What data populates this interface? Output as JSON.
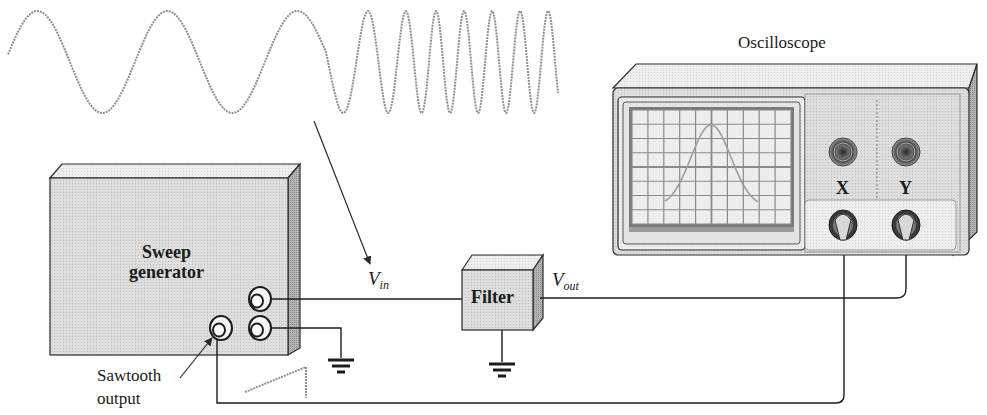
{
  "figure": {
    "input_waveform": {
      "description": "swept-frequency sine (chirp)",
      "slow_cycles": 3,
      "fast_cycles": 6
    },
    "sweep_generator": {
      "label_line1": "Sweep",
      "label_line2": "generator"
    },
    "sawtooth": {
      "label_line1": "Sawtooth",
      "label_line2": "output"
    },
    "signals": {
      "vin_main": "V",
      "vin_sub": "in",
      "vout_main": "V",
      "vout_sub": "out"
    },
    "filter": {
      "label": "Filter"
    },
    "oscilloscope": {
      "title": "Oscilloscope",
      "channel_x": "X",
      "channel_y": "Y",
      "screen_trace": "bell-shaped frequency response"
    },
    "colors": {
      "line": "#2a2a2a",
      "body_fill": "#d9d9d9",
      "body_side": "#a8a8a8",
      "body_top": "#ececec",
      "waveform": "#8a8a8a"
    }
  }
}
